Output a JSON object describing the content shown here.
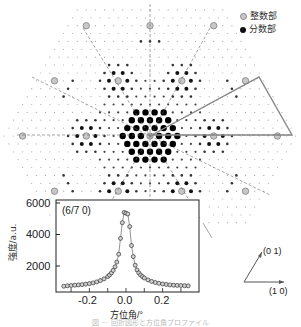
{
  "legend": {
    "items": [
      {
        "label": "整数部",
        "style": "gray-ring",
        "color": "#a8a8a8"
      },
      {
        "label": "分数部",
        "style": "black-dot",
        "color": "#111111"
      }
    ]
  },
  "lattice_vectors": {
    "a1_label": "(1 0)",
    "a2_label": "(0 1)"
  },
  "inset": {
    "annotation": "(6/7 0)"
  },
  "chart_data": {
    "type": "scatter",
    "title": "",
    "annotation": "(6/7 0)",
    "xlabel": "方位角/°",
    "ylabel": "強度/a.u.",
    "xlim": [
      -0.35,
      0.35
    ],
    "ylim": [
      600,
      6200
    ],
    "xticks": [
      -0.2,
      0.0,
      0.2
    ],
    "xtick_labels": [
      "-0.2",
      "0.0",
      "0.2"
    ],
    "yticks": [
      2000,
      4000,
      6000
    ],
    "ytick_labels": [
      "2000",
      "4000",
      "6000"
    ],
    "grid": false,
    "legend_position": "none",
    "series": [
      {
        "name": "(6/7 0) azimuthal profile",
        "marker": "open-circle",
        "line": "fit-curve",
        "x": [
          -0.34,
          -0.32,
          -0.3,
          -0.28,
          -0.26,
          -0.24,
          -0.22,
          -0.2,
          -0.18,
          -0.16,
          -0.14,
          -0.12,
          -0.1,
          -0.09,
          -0.08,
          -0.07,
          -0.06,
          -0.05,
          -0.04,
          -0.03,
          -0.02,
          -0.01,
          0.0,
          0.01,
          0.02,
          0.03,
          0.04,
          0.05,
          0.06,
          0.07,
          0.08,
          0.09,
          0.1,
          0.12,
          0.14,
          0.16,
          0.18,
          0.2,
          0.22,
          0.24,
          0.26,
          0.28,
          0.3,
          0.32,
          0.34
        ],
        "y": [
          720,
          740,
          760,
          780,
          800,
          820,
          850,
          880,
          930,
          990,
          1070,
          1180,
          1330,
          1430,
          1560,
          1720,
          1950,
          2250,
          2750,
          3750,
          4750,
          5400,
          5350,
          5300,
          4500,
          3300,
          2600,
          2050,
          1750,
          1560,
          1430,
          1330,
          1240,
          1120,
          1020,
          950,
          900,
          860,
          830,
          800,
          780,
          770,
          760,
          750,
          740
        ]
      }
    ]
  },
  "caption": "図 ··· 回折図形と方位角プロファイル"
}
